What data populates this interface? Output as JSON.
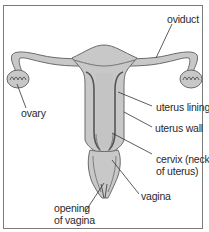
{
  "diagram": {
    "colors": {
      "tissue_fill": "#c8c8c8",
      "tissue_stroke": "#6a6a6a",
      "lining_stroke": "#555555",
      "leader_line": "#333333",
      "label_text": "#2a2a2a",
      "frame": "#7a7a7a"
    },
    "labels": {
      "oviduct": "oviduct",
      "ovary": "ovary",
      "uterus_lining": "uterus lining",
      "uterus_wall": "uterus wall",
      "cervix_line1": "cervix (neck",
      "cervix_line2": "of uterus)",
      "vagina": "vagina",
      "opening_line1": "opening",
      "opening_line2": "of vagina"
    }
  }
}
